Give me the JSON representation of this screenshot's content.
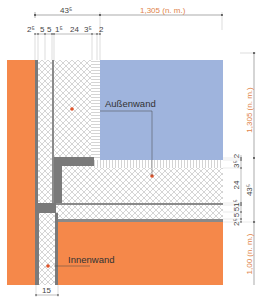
{
  "drawing": {
    "type": "wall-junction-detail",
    "colors": {
      "masonry": "#f5884a",
      "exterior_wall_fill": "#9fb4dd",
      "mortar_grey": "#7a7a7a",
      "insulation_hatch": "#b9b9b9",
      "dimension_line": "#555555",
      "dimension_orange": "#e0844a",
      "marker": "#e0542a"
    },
    "labels": {
      "exterior_wall": "Außenwand",
      "interior_wall": "Innenwand"
    },
    "top_dimensions": {
      "overall_left": "43⁵",
      "overall_right": "1,305 (n. m.)",
      "segments": [
        "2⁵",
        "5",
        "5",
        "1⁵",
        "24",
        "3⁵",
        "2"
      ]
    },
    "right_dimensions": {
      "overall_top": "1,305 (n. m.)",
      "overall_bottom": "1,00 (n. m.)",
      "total": "43⁵",
      "segments": [
        "2",
        "3⁵",
        "24",
        "1⁵",
        "5",
        "5",
        "2⁵"
      ]
    },
    "bottom_dimension": {
      "interior_wall_thickness": "15"
    }
  }
}
